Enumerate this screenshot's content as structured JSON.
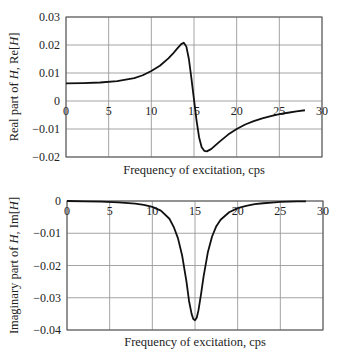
{
  "chart_data": [
    {
      "type": "line",
      "title": "",
      "xlabel": "Frequency of excitation, cps",
      "ylabel": "Real part of H, Re[H]",
      "xlim": [
        0,
        30
      ],
      "ylim": [
        -0.02,
        0.03
      ],
      "xticks": [
        "0",
        "5",
        "10",
        "15",
        "20",
        "25",
        "30"
      ],
      "yticks": [
        "0.03",
        "0.02",
        "0.01",
        "0",
        "-0.01",
        "-0.02"
      ],
      "grid": true,
      "series": [
        {
          "name": "Re[H]",
          "x": [
            0,
            2,
            4,
            6,
            8,
            9,
            10,
            11,
            12,
            12.5,
            13,
            13.5,
            13.8,
            14.1,
            14.4,
            14.7,
            15.0,
            15.3,
            15.6,
            15.9,
            16.2,
            16.5,
            17,
            18,
            19,
            20,
            21,
            22,
            23,
            24,
            25,
            26,
            27,
            28
          ],
          "y": [
            0.0063,
            0.0064,
            0.0066,
            0.0071,
            0.0082,
            0.0092,
            0.0107,
            0.0126,
            0.0152,
            0.0168,
            0.0186,
            0.0203,
            0.0208,
            0.0195,
            0.015,
            0.008,
            0.0005,
            -0.007,
            -0.013,
            -0.0165,
            -0.0178,
            -0.018,
            -0.0172,
            -0.0145,
            -0.012,
            -0.01,
            -0.0084,
            -0.0072,
            -0.0062,
            -0.0054,
            -0.0047,
            -0.0042,
            -0.0037,
            -0.0033
          ]
        }
      ]
    },
    {
      "type": "line",
      "title": "",
      "xlabel": "Frequency of excitation, cps",
      "ylabel": "Imaginary part of H, Im[H]",
      "xlim": [
        0,
        30
      ],
      "ylim": [
        -0.04,
        0
      ],
      "xticks": [
        "0",
        "5",
        "10",
        "15",
        "20",
        "25",
        "30"
      ],
      "yticks": [
        "0",
        "-0.01",
        "-0.02",
        "-0.03",
        "-0.04"
      ],
      "grid": true,
      "series": [
        {
          "name": "Im[H]",
          "x": [
            0,
            2,
            4,
            6,
            8,
            9,
            10,
            11,
            12,
            12.5,
            13,
            13.5,
            14,
            14.3,
            14.6,
            14.8,
            15.0,
            15.2,
            15.4,
            15.7,
            16,
            16.5,
            17,
            17.5,
            18,
            19,
            20,
            21,
            22,
            23,
            24,
            25,
            26,
            27,
            28
          ],
          "y": [
            0,
            -0.0001,
            -0.0002,
            -0.0004,
            -0.0008,
            -0.0012,
            -0.0018,
            -0.003,
            -0.0055,
            -0.008,
            -0.0115,
            -0.017,
            -0.025,
            -0.031,
            -0.035,
            -0.0366,
            -0.037,
            -0.0362,
            -0.034,
            -0.029,
            -0.0235,
            -0.016,
            -0.011,
            -0.0078,
            -0.0058,
            -0.0035,
            -0.0022,
            -0.0015,
            -0.001,
            -0.0007,
            -0.0005,
            -0.0003,
            -0.0002,
            -0.0001,
            -0.0001
          ]
        }
      ]
    }
  ]
}
